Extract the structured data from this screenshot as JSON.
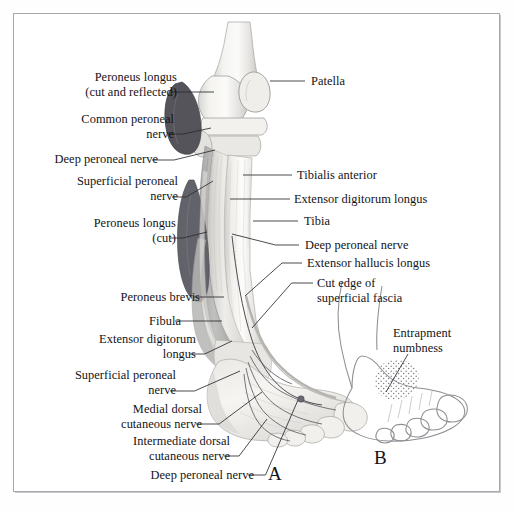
{
  "figure": {
    "panels": [
      {
        "key": "A",
        "letter": "A",
        "caption": "Dissection of anterior leg and dorsum of foot"
      },
      {
        "key": "B",
        "letter": "B",
        "caption": "Outline of foot showing entrapment numbness area"
      }
    ],
    "border_color": "#a8a8ac",
    "background_color": "#ffffff",
    "text_color": "#131316",
    "leader_color": "#2b2b30"
  },
  "labels_left": [
    {
      "id": "peroneus-longus-cut-reflected",
      "lines": [
        "Peroneus longus",
        "(cut and reflected)"
      ],
      "x": 62,
      "y": 70,
      "align": "right",
      "anchor_x": 171,
      "anchor_y": 92,
      "target_x": 214,
      "target_y": 92
    },
    {
      "id": "common-peroneal-nerve",
      "lines": [
        "Common peroneal",
        "nerve"
      ],
      "x": 60,
      "y": 112,
      "align": "right",
      "anchor_x": 168,
      "anchor_y": 134,
      "target_x": 211,
      "target_y": 128
    },
    {
      "id": "deep-peroneal-nerve-upper",
      "lines": [
        "Deep peroneal nerve"
      ],
      "x": 22,
      "y": 152,
      "align": "right",
      "anchor_x": 152,
      "anchor_y": 160,
      "target_x": 215,
      "target_y": 150
    },
    {
      "id": "superficial-peroneal-nerve-upper",
      "lines": [
        "Superficial peroneal",
        "nerve"
      ],
      "x": 56,
      "y": 174,
      "align": "right",
      "anchor_x": 172,
      "anchor_y": 197,
      "target_x": 213,
      "target_y": 181
    },
    {
      "id": "peroneus-longus-cut",
      "lines": [
        "Peroneus longus",
        "(cut)"
      ],
      "x": 66,
      "y": 216,
      "align": "right",
      "anchor_x": 170,
      "anchor_y": 238,
      "target_x": 207,
      "target_y": 232
    },
    {
      "id": "peroneus-brevis",
      "lines": [
        "Peroneus brevis"
      ],
      "x": 92,
      "y": 290,
      "align": "right",
      "anchor_x": 194,
      "anchor_y": 297,
      "target_x": 224,
      "target_y": 297
    },
    {
      "id": "fibula",
      "lines": [
        "Fibula"
      ],
      "x": 128,
      "y": 314,
      "align": "right",
      "anchor_x": 175,
      "anchor_y": 321,
      "target_x": 222,
      "target_y": 321
    },
    {
      "id": "extensor-digitorum-longus-lower",
      "lines": [
        "Extensor digitorum",
        "longus"
      ],
      "x": 57,
      "y": 332,
      "align": "right",
      "anchor_x": 190,
      "anchor_y": 354,
      "target_x": 232,
      "target_y": 341
    },
    {
      "id": "superficial-peroneal-nerve-lower",
      "lines": [
        "Superficial peroneal",
        "nerve"
      ],
      "x": 58,
      "y": 368,
      "align": "right",
      "anchor_x": 170,
      "anchor_y": 391,
      "target_x": 240,
      "target_y": 371
    },
    {
      "id": "medial-dorsal-cutaneous-nerve",
      "lines": [
        "Medial dorsal",
        "cutaneous nerve"
      ],
      "x": 80,
      "y": 402,
      "align": "right",
      "anchor_x": 196,
      "anchor_y": 424,
      "target_x": 262,
      "target_y": 392
    },
    {
      "id": "intermediate-dorsal-cutaneous-nerve",
      "lines": [
        "Intermediate dorsal",
        "cutaneous nerve"
      ],
      "x": 84,
      "y": 434,
      "align": "right",
      "anchor_x": 224,
      "anchor_y": 456,
      "target_x": 267,
      "target_y": 419
    },
    {
      "id": "deep-peroneal-nerve-foot",
      "lines": [
        "Deep peroneal nerve"
      ],
      "x": 118,
      "y": 468,
      "align": "right",
      "anchor_x": 248,
      "anchor_y": 475,
      "target_x": 298,
      "target_y": 400
    }
  ],
  "labels_right": [
    {
      "id": "patella",
      "lines": [
        "Patella"
      ],
      "x": 311,
      "y": 74,
      "align": "left",
      "anchor_x": 305,
      "anchor_y": 81,
      "target_x": 270,
      "target_y": 81
    },
    {
      "id": "tibialis-anterior",
      "lines": [
        "Tibialis anterior"
      ],
      "x": 297,
      "y": 168,
      "align": "left",
      "anchor_x": 292,
      "anchor_y": 175,
      "target_x": 243,
      "target_y": 175
    },
    {
      "id": "extensor-digitorum-longus-upper",
      "lines": [
        "Extensor digitorum longus"
      ],
      "x": 294,
      "y": 192,
      "align": "left",
      "anchor_x": 290,
      "anchor_y": 199,
      "target_x": 230,
      "target_y": 199
    },
    {
      "id": "tibia",
      "lines": [
        "Tibia"
      ],
      "x": 304,
      "y": 214,
      "align": "left",
      "anchor_x": 298,
      "anchor_y": 221,
      "target_x": 253,
      "target_y": 221
    },
    {
      "id": "deep-peroneal-nerve-leg",
      "lines": [
        "Deep peroneal nerve"
      ],
      "x": 305,
      "y": 238,
      "align": "left",
      "anchor_x": 299,
      "anchor_y": 245,
      "target_x": 232,
      "target_y": 234
    },
    {
      "id": "extensor-hallucis-longus",
      "lines": [
        "Extensor hallucis longus"
      ],
      "x": 307,
      "y": 256,
      "align": "left",
      "anchor_x": 302,
      "anchor_y": 263,
      "target_x": 245,
      "target_y": 296
    },
    {
      "id": "cut-edge-superficial-fascia",
      "lines": [
        "Cut edge of",
        "superficial fascia"
      ],
      "x": 317,
      "y": 276,
      "align": "left",
      "anchor_x": 313,
      "anchor_y": 283,
      "target_x": 252,
      "target_y": 328
    },
    {
      "id": "entrapment-numbness",
      "lines": [
        "Entrapment",
        "numbness"
      ],
      "x": 393,
      "y": 326,
      "align": "left",
      "anchor_x": 408,
      "anchor_y": 354,
      "target_x": 386,
      "target_y": 392
    }
  ],
  "panel_letters": [
    {
      "id": "panel-letter-a",
      "text": "A",
      "x": 268,
      "y": 463
    },
    {
      "id": "panel-letter-b",
      "text": "B",
      "x": 374,
      "y": 447
    }
  ]
}
